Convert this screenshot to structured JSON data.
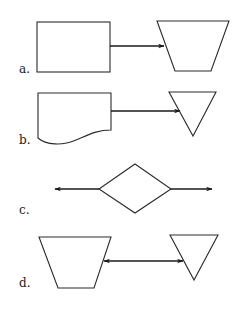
{
  "diagram": {
    "rows": [
      {
        "label": "a.",
        "left_shape": "rectangle (process)",
        "connector": "right-arrow",
        "right_shape": "inverted trapezoid (manual operation)"
      },
      {
        "label": "b.",
        "left_shape": "document",
        "connector": "right-arrow",
        "right_shape": "inverted triangle (merge / offline storage)"
      },
      {
        "label": "c.",
        "left_shape": "left-arrow",
        "connector": "diamond (decision)",
        "right_shape": "right-arrow"
      },
      {
        "label": "d.",
        "left_shape": "inverted trapezoid (manual operation)",
        "connector": "bidirectional-arrow",
        "right_shape": "inverted triangle (merge / offline storage)"
      }
    ],
    "colors": {
      "stroke": "#2a2a2a",
      "background": "#ffffff"
    }
  }
}
